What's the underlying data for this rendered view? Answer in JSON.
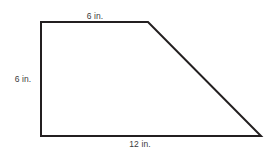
{
  "figure": {
    "kind": "right-trapezoid",
    "stroke_color": "#231f20",
    "background_color": "#ffffff",
    "stroke_width": 2,
    "vertices": {
      "top_left": [
        41,
        22
      ],
      "top_right": [
        148,
        22
      ],
      "bottom_right": [
        261,
        136
      ],
      "bottom_left": [
        41,
        136
      ]
    },
    "labels": {
      "top": "6 in.",
      "left": "6 in.",
      "bottom": "12 in."
    }
  }
}
